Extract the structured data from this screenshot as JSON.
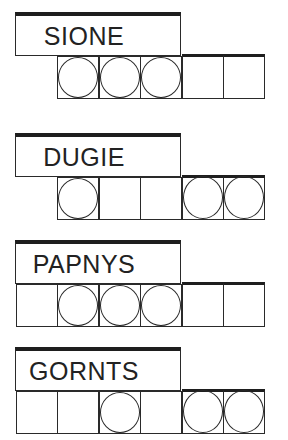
{
  "puzzles": [
    {
      "word": "SIONE",
      "top": 12,
      "cells": [
        null,
        true,
        true,
        true,
        false,
        false
      ]
    },
    {
      "word": "DUGIE",
      "top": 133,
      "cells": [
        null,
        true,
        false,
        false,
        true,
        true
      ]
    },
    {
      "word": "PAPNYS",
      "top": 240,
      "cells": [
        false,
        true,
        true,
        true,
        false,
        false
      ]
    },
    {
      "word": "GORNTS",
      "top": 347,
      "cells": [
        false,
        false,
        true,
        false,
        true,
        true
      ]
    }
  ],
  "legend": {
    "circled": "answer-letter slot (circled)",
    "empty": "plain letter slot",
    "null": "no slot"
  },
  "colors": {
    "ink": "#2a2a2a",
    "background": "#ffffff"
  }
}
